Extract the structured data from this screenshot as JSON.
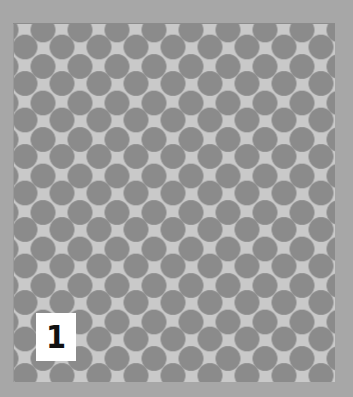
{
  "image": {
    "description": "Swatch of gray polka-dot (staggered circle) pattern on a light gray panel with a gray border",
    "colors": {
      "border": "#a7a7a7",
      "panel_background": "#c9c9c9",
      "dots": "#8b8b8b",
      "label_background": "#ffffff",
      "label_text": "#111111"
    }
  },
  "label": {
    "number": "1"
  }
}
